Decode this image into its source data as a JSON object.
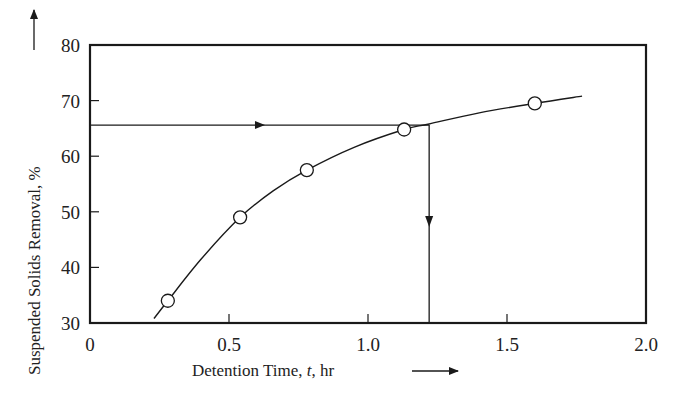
{
  "chart_data": {
    "type": "line",
    "title": "",
    "xlabel": "Detention Time, t, hr",
    "ylabel": "Suspended Solids Removal, %",
    "xlim": [
      0,
      2.0
    ],
    "ylim": [
      30,
      80
    ],
    "x_ticks": [
      "0",
      "0.5",
      "1.0",
      "1.5",
      "2.0"
    ],
    "y_ticks": [
      "30",
      "40",
      "50",
      "60",
      "70",
      "80"
    ],
    "grid": false,
    "legend": null,
    "series": [
      {
        "name": "Measured removal",
        "marker": "open-circle",
        "points": [
          {
            "x": 0.28,
            "y": 34.0
          },
          {
            "x": 0.54,
            "y": 49.0
          },
          {
            "x": 0.78,
            "y": 57.5
          },
          {
            "x": 1.13,
            "y": 64.8
          },
          {
            "x": 1.6,
            "y": 69.5
          }
        ]
      },
      {
        "name": "Fitted curve",
        "marker": "none",
        "points": [
          {
            "x": 0.23,
            "y": 30.8
          },
          {
            "x": 0.28,
            "y": 34.0
          },
          {
            "x": 0.4,
            "y": 41.5
          },
          {
            "x": 0.54,
            "y": 49.0
          },
          {
            "x": 0.66,
            "y": 53.8
          },
          {
            "x": 0.78,
            "y": 57.5
          },
          {
            "x": 0.95,
            "y": 61.6
          },
          {
            "x": 1.13,
            "y": 64.8
          },
          {
            "x": 1.22,
            "y": 65.8
          },
          {
            "x": 1.4,
            "y": 67.8
          },
          {
            "x": 1.6,
            "y": 69.5
          },
          {
            "x": 1.77,
            "y": 70.8
          }
        ]
      }
    ],
    "annotations": [
      {
        "type": "horizontal-arrow",
        "from": {
          "x": 0,
          "y": 65.6
        },
        "to": {
          "x": 1.22,
          "y": 65.6
        },
        "description": "Target removal read across to curve"
      },
      {
        "type": "vertical-arrow",
        "from": {
          "x": 1.22,
          "y": 65.6
        },
        "to": {
          "x": 1.22,
          "y": 30
        },
        "description": "Required detention time read down to axis"
      }
    ]
  },
  "labels": {
    "x_axis_title": "Detention Time, ",
    "x_axis_var": "t",
    "x_axis_unit": ", hr",
    "y_axis_title": "Suspended Solids Removal, %"
  }
}
